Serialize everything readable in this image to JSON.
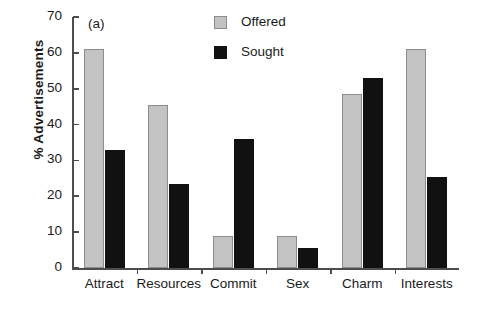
{
  "panel_tag": "(a)",
  "legend": {
    "position": "top-center",
    "entries": [
      {
        "label": "Offered",
        "color": "#c3c3c3",
        "swatch": "offered-swatch"
      },
      {
        "label": "Sought",
        "color": "#111111",
        "swatch": "sought-swatch"
      }
    ]
  },
  "axes": {
    "ylabel": "% Advertisements",
    "xlabel": "",
    "yticks": [
      0,
      10,
      20,
      30,
      40,
      50,
      60,
      70
    ],
    "ytick_labels": [
      "0",
      "10",
      "20",
      "30",
      "40",
      "50",
      "60",
      "70"
    ]
  },
  "chart_data": {
    "type": "bar",
    "title": "(a)",
    "xlabel": "",
    "ylabel": "% Advertisements",
    "ylim": [
      0,
      70
    ],
    "ytick_step": 10,
    "grid": false,
    "legend_position": "top-center",
    "categories": [
      "Attract",
      "Resources",
      "Commit",
      "Sex",
      "Charm",
      "Interests"
    ],
    "series": [
      {
        "name": "Offered",
        "color": "#c3c3c3",
        "values": [
          61,
          45.5,
          9,
          9,
          48.5,
          61
        ]
      },
      {
        "name": "Sought",
        "color": "#111111",
        "values": [
          33,
          23.5,
          36,
          5.5,
          53,
          25.5
        ]
      }
    ]
  }
}
